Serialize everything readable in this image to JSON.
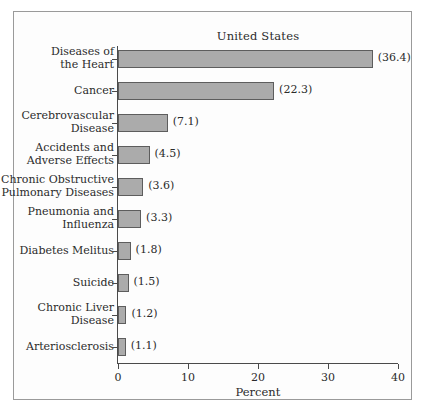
{
  "chart_data": {
    "type": "bar",
    "orientation": "horizontal",
    "title": "United States",
    "xlabel": "Percent",
    "ylabel": "",
    "xlim": [
      0,
      40
    ],
    "xticks": [
      0,
      10,
      20,
      30,
      40
    ],
    "xtick_labels": [
      "0",
      "10",
      "20",
      "30",
      "40"
    ],
    "grid": false,
    "legend": null,
    "bar_color": "#ababab",
    "bar_edge_color": "#5d5d5d",
    "axis_color": "#4a4a4a",
    "frame_color": "#9a9a9a",
    "background": "#fdfdfd",
    "categories": [
      "Diseases of\nthe Heart",
      "Cancer",
      "Cerebrovascular\nDisease",
      "Accidents and\nAdverse Effects",
      "Chronic Obstructive\nPulmonary Diseases",
      "Pneumonia and\nInfluenza",
      "Diabetes Melitus",
      "Suicide",
      "Chronic Liver\nDisease",
      "Arteriosclerosis"
    ],
    "values": [
      36.4,
      22.3,
      7.1,
      4.5,
      3.6,
      3.3,
      1.8,
      1.5,
      1.2,
      1.1
    ],
    "value_labels": [
      "(36.4)",
      "(22.3)",
      "(7.1)",
      "(4.5)",
      "(3.6)",
      "(3.3)",
      "(1.8)",
      "(1.5)",
      "(1.2)",
      "(1.1)"
    ]
  }
}
